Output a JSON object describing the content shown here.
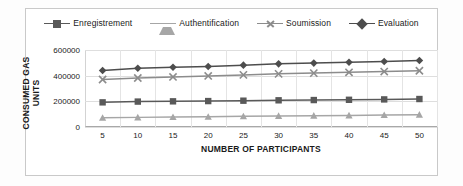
{
  "chart_data": {
    "type": "line",
    "title": "",
    "xlabel": "NUMBER OF PARTICIPANTS",
    "ylabel": "CONSUMED GAS UNITS",
    "x": [
      5,
      10,
      15,
      20,
      25,
      30,
      35,
      40,
      45,
      50
    ],
    "xtick_labels": [
      "5",
      "10",
      "15",
      "20",
      "25",
      "30",
      "35",
      "40",
      "45",
      "50"
    ],
    "ytick_labels": [
      "0",
      "200000",
      "400000",
      "600000"
    ],
    "yticks": [
      0,
      200000,
      400000,
      600000
    ],
    "ylim": [
      0,
      600000
    ],
    "grid": "horizontal-and-vertical",
    "legend_position": "top",
    "series": [
      {
        "name": "Enregistrement",
        "marker": "square",
        "color": "#595959",
        "values": [
          192000,
          198000,
          200000,
          202000,
          205000,
          208000,
          210000,
          212000,
          215000,
          218000
        ]
      },
      {
        "name": "Authentification",
        "marker": "triangle",
        "color": "#a6a6a6",
        "values": [
          72000,
          75000,
          78000,
          80000,
          83000,
          86000,
          88000,
          90000,
          93000,
          96000
        ]
      },
      {
        "name": "Soumission",
        "marker": "x",
        "color": "#8c8c8c",
        "values": [
          370000,
          382000,
          390000,
          398000,
          406000,
          414000,
          420000,
          426000,
          432000,
          438000
        ]
      },
      {
        "name": "Evaluation",
        "marker": "diamond",
        "color": "#4d4d4d",
        "values": [
          440000,
          458000,
          466000,
          472000,
          482000,
          492000,
          498000,
          504000,
          510000,
          518000
        ]
      }
    ]
  }
}
